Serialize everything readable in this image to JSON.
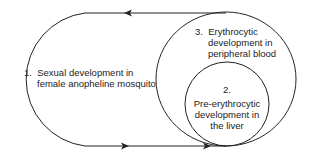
{
  "diagram": {
    "stage1": {
      "num": "1.",
      "line1": "Sexual development in",
      "line2": "female anopheline mosquito"
    },
    "stage3": {
      "num": "3.",
      "line1": "Erythrocytic",
      "line2": "development in",
      "line3": "peripheral blood"
    },
    "stage2": {
      "num": "2.",
      "line1": "Pre-erythrocytic",
      "line2": "development in",
      "line3": "the liver"
    },
    "colors": {
      "stroke": "#222222",
      "text": "#222222"
    }
  }
}
